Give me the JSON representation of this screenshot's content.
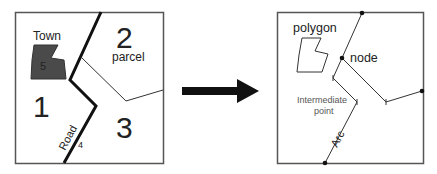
{
  "left_panel": {
    "title": "Real world features",
    "labels": {
      "town": "Town",
      "town_id": "5",
      "parcel_1": "1",
      "parcel_2": "2",
      "parcel_word": "parcel",
      "parcel_3": "3",
      "road": "Road",
      "road_id": "4"
    }
  },
  "arrow": {
    "meaning": "converts-to"
  },
  "right_panel": {
    "labels": {
      "polygon": "polygon",
      "node": "node",
      "intermediate_line1": "Intermediate",
      "intermediate_line2": "point",
      "arc": "Arc"
    }
  },
  "colors": {
    "frame": "#555555",
    "road": "#111111",
    "town_fill": "#4a4a4a",
    "thin_line": "#333333",
    "arrow": "#111111"
  }
}
